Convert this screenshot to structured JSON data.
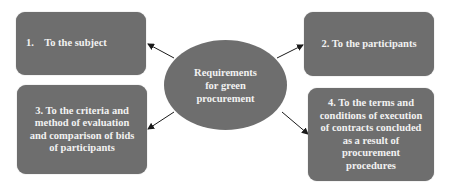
{
  "diagram": {
    "center": {
      "label": "Requirements for green procurement",
      "lines": [
        "Requirements",
        "for green",
        "procurement"
      ]
    },
    "nodes": [
      {
        "id": 1,
        "label": "1.    To the subject"
      },
      {
        "id": 2,
        "label": "2. To the participants"
      },
      {
        "id": 3,
        "label": "3. To the criteria and method of evaluation and comparison of bids of participants"
      },
      {
        "id": 4,
        "label": "4. To the terms and conditions of execution of contracts concluded as a result of procurement procedures"
      }
    ],
    "edges": [
      {
        "from": "center",
        "to": 1
      },
      {
        "from": "center",
        "to": 2
      },
      {
        "from": "center",
        "to": 3
      },
      {
        "from": "center",
        "to": 4
      }
    ],
    "colors": {
      "fill": "#6e6e6e",
      "text": "#f2f2f2",
      "arrow": "#1a1a1a",
      "background": "#ffffff"
    }
  }
}
